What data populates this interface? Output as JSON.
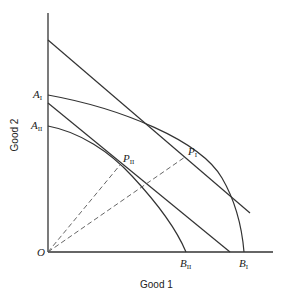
{
  "diagram": {
    "type": "production-possibility-frontiers",
    "axes": {
      "x_label": "Good 1",
      "y_label": "Good 2",
      "origin_label": "O"
    },
    "points": {
      "A1": {
        "main": "A",
        "sub": "I"
      },
      "A2": {
        "main": "A",
        "sub": "II"
      },
      "B1": {
        "main": "B",
        "sub": "I"
      },
      "B2": {
        "main": "B",
        "sub": "II"
      },
      "P1": {
        "main": "P",
        "sub": "I"
      },
      "P2": {
        "main": "P",
        "sub": "II"
      }
    },
    "curves": [
      {
        "name": "frontier-I",
        "from": "A_I",
        "to": "B_I",
        "tangent_point": "P_I"
      },
      {
        "name": "frontier-II",
        "from": "A_II",
        "to": "B_II",
        "tangent_point": "P_II"
      }
    ],
    "lines": [
      {
        "name": "price-line-I",
        "tangent_at": "P_I"
      },
      {
        "name": "price-line-II",
        "tangent_at": "P_II"
      },
      {
        "name": "ray-O-P_I",
        "style": "dashed"
      },
      {
        "name": "ray-O-P_II",
        "style": "dashed"
      }
    ],
    "colors": {
      "ink": "#222222",
      "background": "#ffffff"
    }
  }
}
